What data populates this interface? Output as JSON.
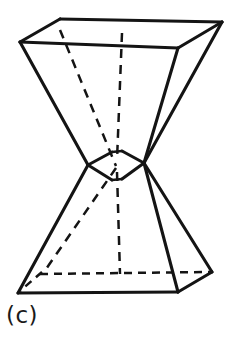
{
  "figure": {
    "caption": "(c)",
    "ink_color": "#141414",
    "background_color": "#ffffff",
    "line_style": {
      "visible": "solid",
      "hidden": "dashed"
    },
    "geometry": {
      "top_face": {
        "name": "top-square-face",
        "vertices": [
          {
            "id": "top-left-front",
            "x": 20,
            "y": 42
          },
          {
            "id": "top-left-rear",
            "x": 60,
            "y": 19
          },
          {
            "id": "top-right-rear",
            "x": 222,
            "y": 22
          },
          {
            "id": "top-right-front",
            "x": 178,
            "y": 48
          }
        ]
      },
      "waist": {
        "name": "waist-pinch",
        "vertices": [
          {
            "id": "waist-left",
            "x": 88,
            "y": 165
          },
          {
            "id": "waist-center",
            "x": 116,
            "y": 166
          },
          {
            "id": "waist-right",
            "x": 144,
            "y": 163
          }
        ]
      },
      "bottom_face": {
        "name": "bottom-square-face",
        "vertices": [
          {
            "id": "bottom-left-front",
            "x": 18,
            "y": 293
          },
          {
            "id": "bottom-left-rear",
            "x": 42,
            "y": 272
          },
          {
            "id": "bottom-right-rear",
            "x": 212,
            "y": 272
          },
          {
            "id": "bottom-right-front",
            "x": 178,
            "y": 292
          }
        ]
      },
      "hidden_edges": [
        {
          "id": "top-rear-left-diagonal",
          "from": "top-left-rear",
          "to": "waist-center"
        },
        {
          "id": "top-rear-mid-vertical",
          "from": "top-rear-mid",
          "to": "waist-center"
        },
        {
          "id": "bottom-rear-left-diagonal",
          "from": "waist-center",
          "to": "bottom-left-rear"
        },
        {
          "id": "bottom-rear-mid-vertical",
          "from": "waist-center",
          "to": "bottom-rear-mid"
        },
        {
          "id": "bottom-rear-horizontal",
          "from": "bottom-left-rear",
          "to": "bottom-right-rear"
        }
      ]
    }
  }
}
